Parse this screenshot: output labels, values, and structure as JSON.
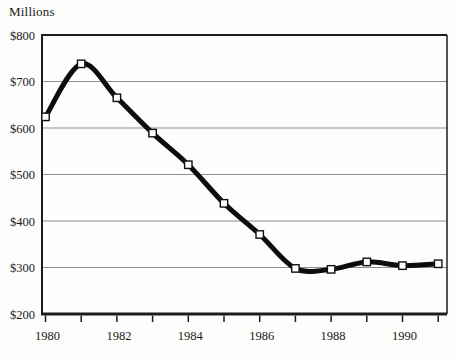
{
  "chart_data": {
    "type": "line",
    "title": "",
    "ylabel": "Millions",
    "xlabel": "",
    "x": [
      1980,
      1981,
      1982,
      1983,
      1984,
      1985,
      1986,
      1987,
      1988,
      1989,
      1990,
      1991
    ],
    "series": [
      {
        "name": "value-millions",
        "values": [
          624,
          738,
          665,
          589,
          521,
          438,
          371,
          298,
          296,
          312,
          304,
          308
        ]
      }
    ],
    "ylim": [
      200,
      800
    ],
    "ytick_values": [
      800,
      700,
      600,
      500,
      400,
      300,
      200
    ],
    "ytick_labels": [
      "$800",
      "$700",
      "$600",
      "$500",
      "$400",
      "$300",
      "$200"
    ],
    "xtick_years": [
      1980,
      1981,
      1982,
      1983,
      1984,
      1985,
      1986,
      1987,
      1988,
      1989,
      1990,
      1991
    ],
    "xtick_labeled_years": [
      1980,
      1982,
      1984,
      1986,
      1988,
      1990
    ],
    "xtick_labels": [
      "1980",
      "1982",
      "1984",
      "1986",
      "1988",
      "1990"
    ],
    "grid": "horizontal",
    "legend": "none",
    "marker": "white-square",
    "colors": {
      "line": "#0d0d0d",
      "marker_fill": "#ffffff",
      "marker_stroke": "#111111",
      "grid": "#8f8f8f",
      "axis": "#1c1c1c",
      "text": "#1a1a1a",
      "background": "#fdfdfc"
    }
  }
}
